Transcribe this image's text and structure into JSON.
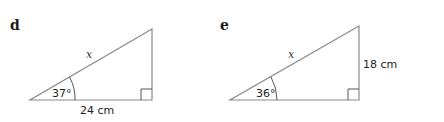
{
  "figures": [
    {
      "label": "d",
      "hypotenuse_label": "x",
      "angle_label": "37°",
      "base_label": "24 cm",
      "side_label": ""
    },
    {
      "label": "e",
      "hypotenuse_label": "x",
      "angle_label": "36°",
      "base_label": "",
      "side_label": "18 cm"
    }
  ],
  "colors": {
    "line": "#8a8a8a",
    "text": "#222222"
  }
}
